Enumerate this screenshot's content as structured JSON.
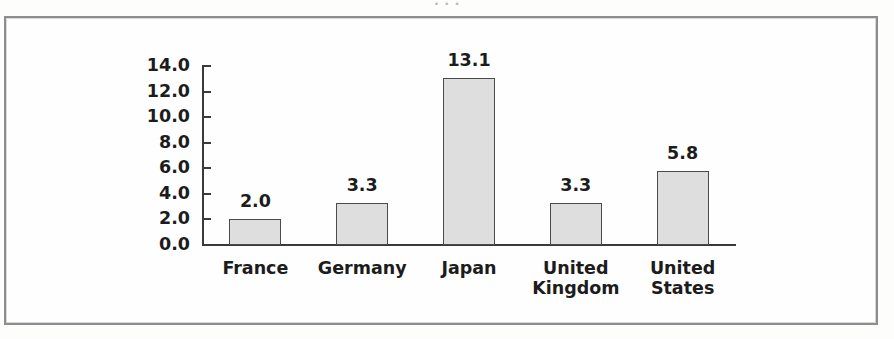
{
  "page": {
    "top_artifact_text": "· · ·"
  },
  "chart_data": {
    "type": "bar",
    "title": "",
    "xlabel": "",
    "ylabel": "",
    "categories": [
      "France",
      "Germany",
      "Japan",
      "United Kingdom",
      "United States"
    ],
    "category_label_lines": [
      [
        "France"
      ],
      [
        "Germany"
      ],
      [
        "Japan"
      ],
      [
        "United",
        "Kingdom"
      ],
      [
        "United",
        "States"
      ]
    ],
    "values": [
      2.0,
      3.3,
      13.1,
      3.3,
      5.8
    ],
    "value_labels": [
      "2.0",
      "3.3",
      "13.1",
      "3.3",
      "5.8"
    ],
    "ylim": [
      0.0,
      14.0
    ],
    "ytick_step": 2.0,
    "ytick_labels": [
      "14.0",
      "12.0",
      "10.0",
      "8.0",
      "6.0",
      "4.0",
      "2.0",
      "0.0"
    ],
    "ytick_values": [
      14.0,
      12.0,
      10.0,
      8.0,
      6.0,
      4.0,
      2.0,
      0.0
    ],
    "grid": false,
    "legend": false,
    "bar_fill_color": "#dedede",
    "bar_edge_color": "#4a4a4a",
    "axis_color": "#3a3a3a",
    "text_color": "#1c1c1c",
    "background_color": "#fefefe"
  }
}
